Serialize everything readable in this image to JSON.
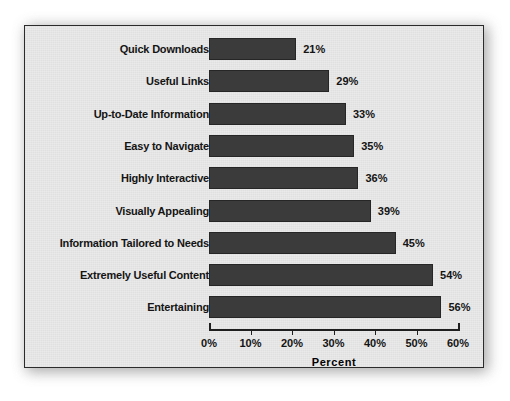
{
  "chart_data": {
    "type": "bar",
    "orientation": "horizontal",
    "title": "",
    "xlabel": "Percent",
    "ylabel": "",
    "xlim": [
      0,
      60
    ],
    "xticks": [
      "0%",
      "10%",
      "20%",
      "30%",
      "40%",
      "50%",
      "60%"
    ],
    "xtick_values": [
      0,
      10,
      20,
      30,
      40,
      50,
      60
    ],
    "grid": false,
    "legend": null,
    "categories": [
      "Quick Downloads",
      "Useful Links",
      "Up-to-Date Information",
      "Easy to Navigate",
      "Highly Interactive",
      "Visually Appealing",
      "Information Tailored to Needs",
      "Extremely Useful Content",
      "Entertaining"
    ],
    "values": [
      21,
      29,
      33,
      35,
      36,
      39,
      45,
      54,
      56
    ],
    "value_labels": [
      "21%",
      "29%",
      "33%",
      "35%",
      "36%",
      "39%",
      "45%",
      "54%",
      "56%"
    ],
    "colors": {
      "bar_fill": "#3b3b3b",
      "bar_stroke": "#262626",
      "panel_background": "#e9e9e9",
      "panel_border": "#2b2b2b",
      "text": "#141414",
      "axis": "#1f1f1f",
      "page_background": "#ffffff"
    }
  }
}
